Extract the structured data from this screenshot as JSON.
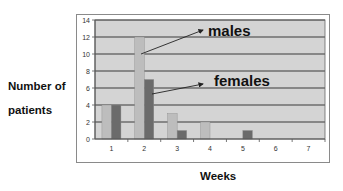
{
  "chart_data": {
    "type": "bar",
    "title": "",
    "xlabel": "Weeks",
    "ylabel": "Number of patients",
    "ylabel_lines": [
      "Number of",
      "patients"
    ],
    "categories": [
      "1",
      "2",
      "3",
      "4",
      "5",
      "6",
      "7"
    ],
    "series": [
      {
        "name": "males",
        "color": "#bdbdbd",
        "values": [
          4,
          12,
          3,
          2,
          0,
          0,
          0
        ]
      },
      {
        "name": "females",
        "color": "#6b6b6b",
        "values": [
          4,
          7,
          1,
          0,
          1,
          0,
          0
        ]
      }
    ],
    "ylim": [
      0,
      14
    ],
    "yticks": [
      0,
      2,
      4,
      6,
      8,
      10,
      12,
      14
    ],
    "grid": true,
    "legend": "annotations with arrows",
    "annotations": [
      {
        "text": "males",
        "points_to": "week 2 males bar"
      },
      {
        "text": "females",
        "points_to": "week 2 females bar"
      }
    ],
    "plot_background": "#d4d4d4",
    "gridline_color": "#3a3a3a"
  }
}
